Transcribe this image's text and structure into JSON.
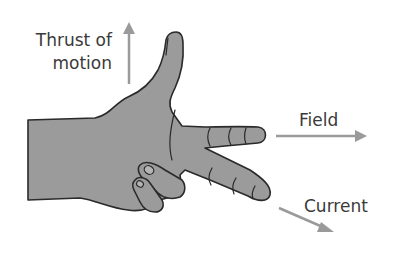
{
  "diagram": {
    "labels": {
      "thrust_line1": "Thrust of",
      "thrust_line2": "motion",
      "field": "Field",
      "current": "Current"
    },
    "colors": {
      "skin": "#9b9b9b",
      "outline": "#2a2a2a",
      "arrow": "#9a9a9a",
      "text": "#3a3a3a"
    }
  }
}
